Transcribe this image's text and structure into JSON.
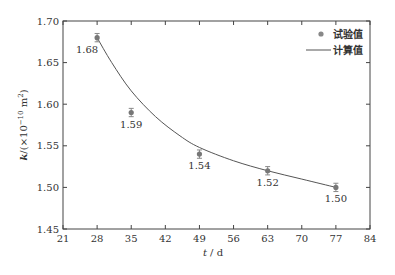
{
  "chart_data": {
    "type": "scatter",
    "title": "",
    "xlabel": "t / d",
    "ylabel": "k /(×10^-10 m^2)",
    "ylabel_parts": {
      "var": "k",
      "unit_prefix": "/(×10",
      "exp": "−10",
      "unit": " m",
      "unit_exp": "2",
      "close": ")"
    },
    "xlabel_parts": {
      "var": "t",
      "unit": " / d"
    },
    "xlim": [
      21,
      84
    ],
    "ylim": [
      1.45,
      1.7
    ],
    "xticks": [
      21,
      28,
      35,
      42,
      49,
      56,
      63,
      70,
      77,
      84
    ],
    "yticks": [
      1.45,
      1.5,
      1.55,
      1.6,
      1.65,
      1.7
    ],
    "ytick_labels": [
      "1.45",
      "1.50",
      "1.55",
      "1.60",
      "1.65",
      "1.70"
    ],
    "grid": false,
    "legend_position": "upper right",
    "series": [
      {
        "name": "试验值",
        "kind": "scatter-with-errorbars",
        "x": [
          28,
          35,
          49,
          63,
          77
        ],
        "y": [
          1.68,
          1.59,
          1.54,
          1.52,
          1.5
        ],
        "labels": [
          "1.68",
          "1.59",
          "1.54",
          "1.52",
          "1.50"
        ],
        "error": 0.005,
        "color": "#777777"
      },
      {
        "name": "计算值",
        "kind": "line",
        "x": [
          28,
          31,
          35,
          40,
          45,
          49,
          56,
          63,
          70,
          77
        ],
        "y": [
          1.68,
          1.65,
          1.616,
          1.585,
          1.562,
          1.548,
          1.532,
          1.52,
          1.51,
          1.5
        ],
        "color": "#555555"
      }
    ]
  },
  "legend": {
    "items": [
      {
        "label": "试验值",
        "symbol": "dot"
      },
      {
        "label": "计算值",
        "symbol": "line"
      }
    ]
  }
}
